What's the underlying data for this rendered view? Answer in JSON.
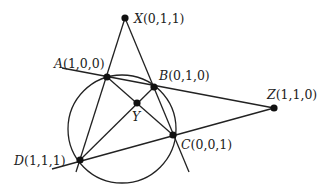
{
  "diagram": {
    "circle": {
      "cx": 122,
      "cy": 129,
      "r": 54
    },
    "points": {
      "X": {
        "name": "X",
        "coords": "(0,1,1)",
        "x": 125,
        "y": 18
      },
      "A": {
        "name": "A",
        "coords": "(1,0,0)",
        "x": 107,
        "y": 77
      },
      "B": {
        "name": "B",
        "coords": "(0,1,0)",
        "x": 154,
        "y": 87
      },
      "Y": {
        "name": "Y",
        "coords": "",
        "x": 137,
        "y": 103
      },
      "C": {
        "name": "C",
        "coords": "(0,0,1)",
        "x": 173,
        "y": 135
      },
      "D": {
        "name": "D",
        "coords": "(1,1,1)",
        "x": 80,
        "y": 160
      },
      "Z": {
        "name": "Z",
        "coords": "(1,1,0)",
        "x": 274,
        "y": 108
      }
    },
    "line_color": "#222222",
    "point_color": "#111111"
  }
}
